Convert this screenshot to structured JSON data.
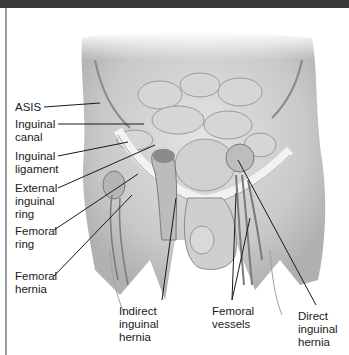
{
  "figure": {
    "left_labels": [
      {
        "id": "asis",
        "text": "ASIS"
      },
      {
        "id": "inguinal-canal",
        "text": "Inguinal\ncanal"
      },
      {
        "id": "inguinal-ligament",
        "text": "Inguinal\nligament"
      },
      {
        "id": "external-inguinal-ring",
        "text": "External\ninguinal\nring"
      },
      {
        "id": "femoral-ring",
        "text": "Femoral\nring"
      },
      {
        "id": "femoral-hernia",
        "text": "Femoral\nhernia"
      }
    ],
    "bottom_labels": [
      {
        "id": "indirect-inguinal-hernia",
        "text": "Indirect\ninguinal\nhernia"
      },
      {
        "id": "femoral-vessels",
        "text": "Femoral\nvessels"
      },
      {
        "id": "direct-inguinal-hernia",
        "text": "Direct\ninguinal\nhernia"
      }
    ]
  }
}
